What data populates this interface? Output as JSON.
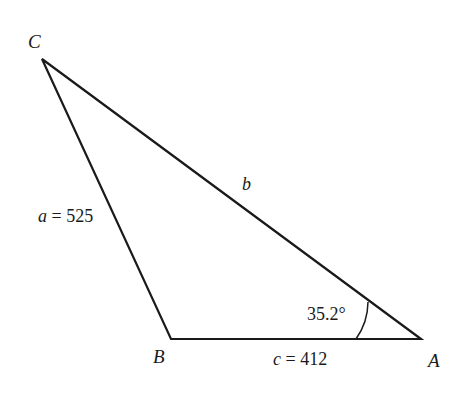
{
  "diagram": {
    "type": "triangle",
    "vertices": {
      "C": {
        "label": "C",
        "x": 42,
        "y": 59
      },
      "B": {
        "label": "B",
        "x": 171,
        "y": 339
      },
      "A": {
        "label": "A",
        "x": 421,
        "y": 339
      }
    },
    "sides": {
      "a": {
        "var": "a",
        "text": " = 525"
      },
      "b": {
        "var": "b",
        "text": ""
      },
      "c": {
        "var": "c",
        "text": " = 412"
      }
    },
    "angle_A": {
      "text": "35.2°"
    },
    "colors": {
      "stroke": "#1a1a1a",
      "background": "#ffffff"
    }
  }
}
